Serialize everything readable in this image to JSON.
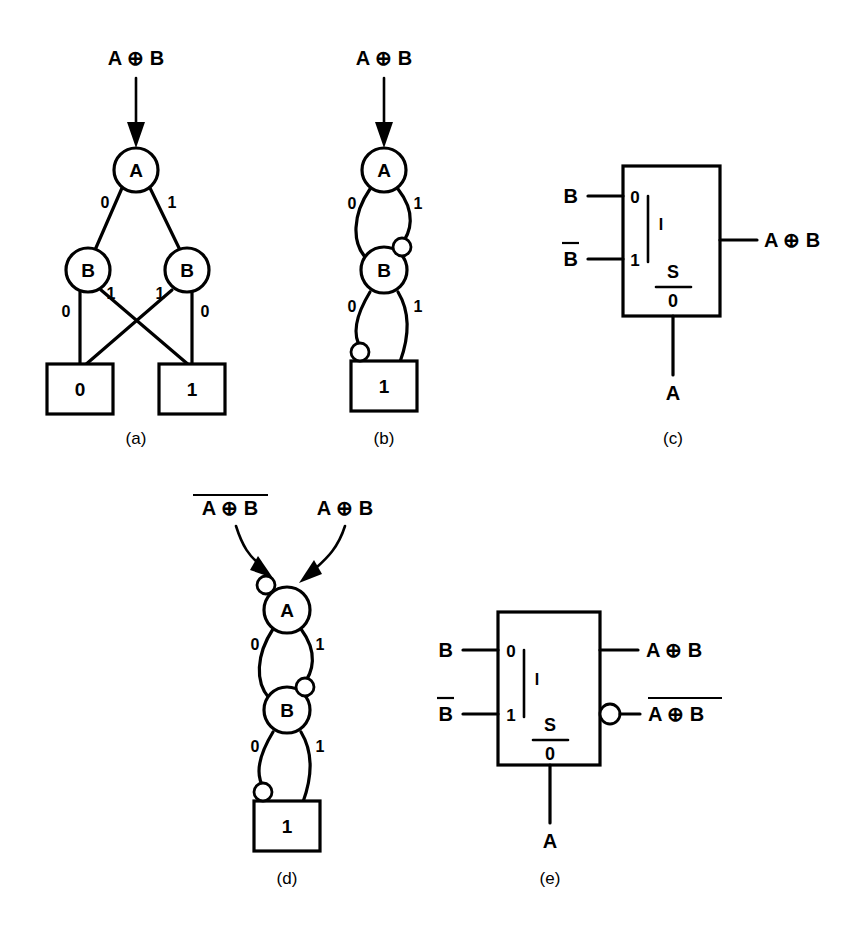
{
  "figure": {
    "ink_color": "#000000",
    "background_color": "#ffffff",
    "xor_symbol": "⊕"
  },
  "panels": [
    {
      "id": "a",
      "caption": "(a)",
      "type": "binary-decision-diagram",
      "input_label": "A ⊕ B",
      "input_overlined": false,
      "nodes": [
        {
          "id": "a-root",
          "label": "A",
          "level": 0
        },
        {
          "id": "a-b-left",
          "label": "B",
          "level": 1
        },
        {
          "id": "a-b-right",
          "label": "B",
          "level": 1
        }
      ],
      "terminals": [
        {
          "id": "a-term-0",
          "label": "0"
        },
        {
          "id": "a-term-1",
          "label": "1"
        }
      ],
      "edges": [
        {
          "from": "a-root",
          "to": "a-b-left",
          "label": "0",
          "complemented": false
        },
        {
          "from": "a-root",
          "to": "a-b-right",
          "label": "1",
          "complemented": false
        },
        {
          "from": "a-b-left",
          "to": "a-term-0",
          "label": "0",
          "complemented": false
        },
        {
          "from": "a-b-left",
          "to": "a-term-1",
          "label": "1",
          "complemented": false
        },
        {
          "from": "a-b-right",
          "to": "a-term-0",
          "label": "1",
          "complemented": false
        },
        {
          "from": "a-b-right",
          "to": "a-term-1",
          "label": "0",
          "complemented": false
        }
      ]
    },
    {
      "id": "b",
      "caption": "(b)",
      "type": "binary-decision-diagram",
      "input_label": "A ⊕ B",
      "input_overlined": false,
      "nodes": [
        {
          "id": "b-root",
          "label": "A",
          "level": 0
        },
        {
          "id": "b-node-b",
          "label": "B",
          "level": 1
        }
      ],
      "terminals": [
        {
          "id": "b-term-1",
          "label": "1"
        }
      ],
      "edges": [
        {
          "from": "b-root",
          "to": "b-node-b",
          "label": "0",
          "complemented": false
        },
        {
          "from": "b-root",
          "to": "b-node-b",
          "label": "1",
          "complemented": true
        },
        {
          "from": "b-node-b",
          "to": "b-term-1",
          "label": "0",
          "complemented": true
        },
        {
          "from": "b-node-b",
          "to": "b-term-1",
          "label": "1",
          "complemented": false
        }
      ]
    },
    {
      "id": "c",
      "caption": "(c)",
      "type": "multiplexer",
      "port_labels": {
        "data_0": "0",
        "data_1": "1",
        "mux_marker": "I",
        "select_top": "S",
        "select_bottom": "0"
      },
      "inputs": [
        {
          "label": "B",
          "overlined": false,
          "port": "0"
        },
        {
          "label": "B",
          "overlined": true,
          "port": "1"
        }
      ],
      "select_input": {
        "label": "A",
        "overlined": false
      },
      "outputs": [
        {
          "label": "A ⊕ B",
          "overlined": false,
          "inverted": false
        }
      ]
    },
    {
      "id": "d",
      "caption": "(d)",
      "type": "binary-decision-diagram",
      "input_labels": [
        {
          "label": "A ⊕ B",
          "overlined": true,
          "complemented_edge": true
        },
        {
          "label": "A ⊕ B",
          "overlined": false,
          "complemented_edge": false
        }
      ],
      "nodes": [
        {
          "id": "d-root",
          "label": "A",
          "level": 0
        },
        {
          "id": "d-node-b",
          "label": "B",
          "level": 1
        }
      ],
      "terminals": [
        {
          "id": "d-term-1",
          "label": "1"
        }
      ],
      "edges": [
        {
          "from": "d-root",
          "to": "d-node-b",
          "label": "0",
          "complemented": false
        },
        {
          "from": "d-root",
          "to": "d-node-b",
          "label": "1",
          "complemented": true
        },
        {
          "from": "d-node-b",
          "to": "d-term-1",
          "label": "0",
          "complemented": true
        },
        {
          "from": "d-node-b",
          "to": "d-term-1",
          "label": "1",
          "complemented": false
        }
      ]
    },
    {
      "id": "e",
      "caption": "(e)",
      "type": "multiplexer",
      "port_labels": {
        "data_0": "0",
        "data_1": "1",
        "mux_marker": "I",
        "select_top": "S",
        "select_bottom": "0"
      },
      "inputs": [
        {
          "label": "B",
          "overlined": false,
          "port": "0"
        },
        {
          "label": "B",
          "overlined": true,
          "port": "1"
        }
      ],
      "select_input": {
        "label": "A",
        "overlined": false
      },
      "outputs": [
        {
          "label": "A ⊕ B",
          "overlined": false,
          "inverted": false
        },
        {
          "label": "A ⊕ B",
          "overlined": true,
          "inverted": true
        }
      ]
    }
  ],
  "text": {
    "panel_a": {
      "input": "A ⊕ B",
      "root": "A",
      "b_left": "B",
      "b_right": "B",
      "edge_root_0": "0",
      "edge_root_1": "1",
      "edge_bl_0": "0",
      "edge_bl_1": "1",
      "edge_br_1": "1",
      "edge_br_0": "0",
      "term_left": "0",
      "term_right": "1",
      "caption": "(a)"
    },
    "panel_b": {
      "input": "A ⊕ B",
      "root": "A",
      "node_b": "B",
      "edge_root_0": "0",
      "edge_root_1": "1",
      "edge_b_0": "0",
      "edge_b_1": "1",
      "term": "1",
      "caption": "(b)"
    },
    "panel_c": {
      "in_top": "B",
      "in_bot": "B",
      "port_0": "0",
      "port_1": "1",
      "marker_i": "I",
      "sel_s": "S",
      "sel_0": "0",
      "select": "A",
      "out": "A ⊕ B",
      "caption": "(c)"
    },
    "panel_d": {
      "input_left": "A ⊕ B",
      "input_right": "A ⊕ B",
      "root": "A",
      "node_b": "B",
      "edge_root_0": "0",
      "edge_root_1": "1",
      "edge_b_0": "0",
      "edge_b_1": "1",
      "term": "1",
      "caption": "(d)"
    },
    "panel_e": {
      "in_top": "B",
      "in_bot": "B",
      "port_0": "0",
      "port_1": "1",
      "marker_i": "I",
      "sel_s": "S",
      "sel_0": "0",
      "select": "A",
      "out_top": "A ⊕ B",
      "out_bot": "A ⊕ B",
      "caption": "(e)"
    }
  }
}
